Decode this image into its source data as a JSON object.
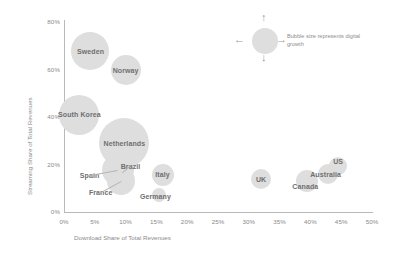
{
  "chart_data": {
    "type": "scatter",
    "title": "",
    "xlabel": "Download Share of Total Revenues",
    "ylabel": "Streaming Share of Total Revenues",
    "xlim": [
      0,
      50
    ],
    "ylim": [
      0,
      80
    ],
    "xticks": [
      "0%",
      "5%",
      "10%",
      "15%",
      "20%",
      "25%",
      "30%",
      "35%",
      "40%",
      "45%",
      "50%"
    ],
    "yticks": [
      "0%",
      "20%",
      "40%",
      "60%",
      "80%"
    ],
    "grid": false,
    "legend_position": "top-right",
    "size_encoding": "Bubble size represents digital growth",
    "bubble_color": "#dedede",
    "label_color": "#6f6f6f",
    "axis_color": "#b9b9b9",
    "tick_color": "#8a8a8a",
    "points": [
      {
        "name": "Sweden",
        "x": 4.3,
        "y": 68.0,
        "size": 38,
        "label_dx": 0,
        "label_dy": 0
      },
      {
        "name": "Norway",
        "x": 10.0,
        "y": 60.0,
        "size": 30,
        "label_dx": 0,
        "label_dy": 0
      },
      {
        "name": "South Korea",
        "x": 2.5,
        "y": 41.0,
        "size": 40,
        "label_dx": 0,
        "label_dy": -1
      },
      {
        "name": "Netherlands",
        "x": 9.8,
        "y": 29.0,
        "size": 50,
        "label_dx": 0,
        "label_dy": 0
      },
      {
        "name": "Brazil",
        "x": 9.5,
        "y": 16.5,
        "size": 5,
        "label_dx": 8,
        "label_dy": -7
      },
      {
        "name": "Spain",
        "x": 8.7,
        "y": 17.5,
        "size": 32,
        "label_dx": -28,
        "label_dy": 5
      },
      {
        "name": "France",
        "x": 9.2,
        "y": 13.0,
        "size": 28,
        "label_dx": -20,
        "label_dy": 11
      },
      {
        "name": "Italy",
        "x": 16.0,
        "y": 15.5,
        "size": 22,
        "label_dx": 0,
        "label_dy": -1
      },
      {
        "name": "Germany",
        "x": 15.5,
        "y": 7.0,
        "size": 14,
        "label_dx": -4,
        "label_dy": 1
      },
      {
        "name": "UK",
        "x": 32.0,
        "y": 14.0,
        "size": 20,
        "label_dx": 0,
        "label_dy": 0
      },
      {
        "name": "Canada",
        "x": 39.5,
        "y": 13.0,
        "size": 22,
        "label_dx": -2,
        "label_dy": 5
      },
      {
        "name": "Australia",
        "x": 42.8,
        "y": 16.0,
        "size": 20,
        "label_dx": -2,
        "label_dy": 0
      },
      {
        "name": "US",
        "x": 44.5,
        "y": 19.5,
        "size": 18,
        "label_dx": 0,
        "label_dy": -5
      }
    ]
  },
  "legend": {
    "text": "Bubble size represents digital growth",
    "arrow_up": "↑",
    "arrow_down": "↓",
    "arrow_left": "←",
    "arrow_right": "→"
  }
}
